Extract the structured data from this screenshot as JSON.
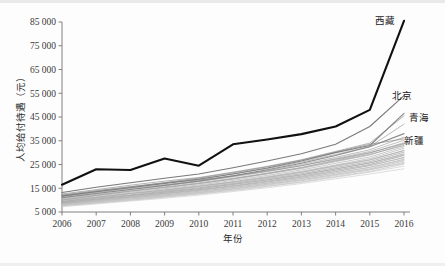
{
  "chart_data": {
    "type": "line",
    "title": "",
    "xlabel": "年份",
    "ylabel": "人均给付待遇（元）",
    "x": [
      2006,
      2007,
      2008,
      2009,
      2010,
      2011,
      2012,
      2013,
      2014,
      2015,
      2016
    ],
    "xtick_labels": [
      "2006",
      "2007",
      "2008",
      "2009",
      "2010",
      "2011",
      "2012",
      "2013",
      "2014",
      "2015",
      "2016"
    ],
    "ytick_labels": [
      "5 000",
      "15 000",
      "25 000",
      "35 000",
      "45 000",
      "55 000",
      "65 000",
      "75 000",
      "85 000"
    ],
    "ytick_values": [
      5000,
      15000,
      25000,
      35000,
      45000,
      55000,
      65000,
      75000,
      85000
    ],
    "ylim": [
      5000,
      85000
    ],
    "xlim": [
      2006,
      2016
    ],
    "grid": false,
    "legend_position": "inline-end-of-line",
    "annotations": [
      "西藏",
      "北京",
      "青海",
      "新疆"
    ],
    "colors": {
      "highlight": "#111111",
      "beijing": "#6e6e6e",
      "qinghai": "#7a7a7a",
      "xinjiang": "#838383",
      "background_lines": "#9a9a9a",
      "axis": "#808080",
      "text": "#2b2b2b"
    },
    "series": [
      {
        "name": "西藏",
        "label": "西藏",
        "highlight": true,
        "color": "#111111",
        "width": 2.1,
        "values": [
          16500,
          23000,
          22700,
          27500,
          24500,
          33500,
          35500,
          37800,
          41000,
          48000,
          85500
        ]
      },
      {
        "name": "北京",
        "label": "北京",
        "highlight": false,
        "color": "#6e6e6e",
        "width": 1.1,
        "values": [
          13200,
          15400,
          17300,
          19200,
          21000,
          23600,
          26500,
          29500,
          33500,
          41000,
          54000
        ]
      },
      {
        "name": "青海",
        "label": "青海",
        "highlight": false,
        "color": "#7a7a7a",
        "width": 1.1,
        "values": [
          11800,
          13500,
          15200,
          17000,
          18800,
          21000,
          23500,
          26500,
          30000,
          33000,
          46500
        ]
      },
      {
        "name": "新疆",
        "label": "新疆",
        "highlight": false,
        "color": "#838383",
        "width": 1.1,
        "values": [
          11000,
          12800,
          14500,
          16200,
          18000,
          20200,
          22800,
          25500,
          28800,
          32500,
          38000
        ]
      },
      {
        "name": "省份-05",
        "label": "",
        "highlight": false,
        "color": "#8d8d8d",
        "width": 0.9,
        "values": [
          12600,
          14400,
          16300,
          18000,
          19500,
          21800,
          24200,
          27000,
          30500,
          34000,
          45500
        ]
      },
      {
        "name": "省份-06",
        "label": "",
        "highlight": false,
        "color": "#949494",
        "width": 0.9,
        "values": [
          12000,
          13800,
          15500,
          17200,
          18900,
          21000,
          23300,
          26000,
          29200,
          32500,
          42000
        ]
      },
      {
        "name": "省份-07",
        "label": "",
        "highlight": false,
        "color": "#9a9a9a",
        "width": 0.9,
        "values": [
          11500,
          13200,
          14900,
          16500,
          18200,
          20200,
          22500,
          25000,
          28000,
          31200,
          36500
        ]
      },
      {
        "name": "省份-08",
        "label": "",
        "highlight": false,
        "color": "#a0a0a0",
        "width": 0.9,
        "values": [
          11200,
          12900,
          14500,
          16100,
          17800,
          19800,
          22000,
          24500,
          27500,
          30500,
          35200
        ]
      },
      {
        "name": "省份-09",
        "label": "",
        "highlight": false,
        "color": "#a4a4a4",
        "width": 0.9,
        "values": [
          10800,
          12400,
          14000,
          15600,
          17300,
          19200,
          21400,
          23800,
          26800,
          29800,
          34200
        ]
      },
      {
        "name": "省份-10",
        "label": "",
        "highlight": false,
        "color": "#a8a8a8",
        "width": 0.9,
        "values": [
          10500,
          12100,
          13700,
          15200,
          16900,
          18800,
          21000,
          23300,
          26200,
          29000,
          33500
        ]
      },
      {
        "name": "省份-11",
        "label": "",
        "highlight": false,
        "color": "#ababab",
        "width": 0.9,
        "values": [
          10200,
          11800,
          13300,
          14800,
          16400,
          18300,
          20400,
          22700,
          25500,
          28200,
          32500
        ]
      },
      {
        "name": "省份-12",
        "label": "",
        "highlight": false,
        "color": "#adadad",
        "width": 0.9,
        "values": [
          9900,
          11400,
          12900,
          14400,
          16000,
          17800,
          19900,
          22100,
          24800,
          27500,
          31800
        ]
      },
      {
        "name": "省份-13",
        "label": "",
        "highlight": false,
        "color": "#b0b0b0",
        "width": 0.9,
        "values": [
          9600,
          11100,
          12600,
          14000,
          15600,
          17400,
          19400,
          21600,
          24200,
          26800,
          31000
        ]
      },
      {
        "name": "省份-14",
        "label": "",
        "highlight": false,
        "color": "#999999",
        "width": 0.9,
        "values": [
          9300,
          10800,
          12200,
          13700,
          15200,
          17000,
          19000,
          21100,
          23700,
          26200,
          30200
        ]
      },
      {
        "name": "省份-15",
        "label": "",
        "highlight": false,
        "color": "#8f8f8f",
        "width": 0.9,
        "values": [
          9000,
          10400,
          11900,
          13300,
          14800,
          16600,
          18500,
          20600,
          23100,
          25600,
          29500
        ]
      },
      {
        "name": "省份-16",
        "label": "",
        "highlight": false,
        "color": "#959595",
        "width": 0.9,
        "values": [
          8700,
          10100,
          11500,
          12900,
          14400,
          16100,
          18000,
          20100,
          22600,
          25000,
          28800
        ]
      },
      {
        "name": "省份-17",
        "label": "",
        "highlight": false,
        "color": "#9e9e9e",
        "width": 0.9,
        "values": [
          8400,
          9800,
          11200,
          12600,
          14100,
          15800,
          17600,
          19600,
          22000,
          24500,
          28000
        ]
      },
      {
        "name": "省份-18",
        "label": "",
        "highlight": false,
        "color": "#a6a6a6",
        "width": 0.9,
        "values": [
          8200,
          9500,
          10900,
          12200,
          13700,
          15300,
          17100,
          19100,
          21400,
          23800,
          27200
        ]
      },
      {
        "name": "省份-19",
        "label": "",
        "highlight": false,
        "color": "#b2b2b2",
        "width": 0.9,
        "values": [
          8000,
          9300,
          10600,
          11900,
          13300,
          14900,
          16700,
          18600,
          20900,
          23200,
          26500
        ]
      },
      {
        "name": "省份-20",
        "label": "",
        "highlight": false,
        "color": "#b6b6b6",
        "width": 0.9,
        "values": [
          7800,
          9000,
          10300,
          11600,
          13000,
          14600,
          16300,
          18200,
          20400,
          22700,
          25900
        ]
      },
      {
        "name": "省份-21",
        "label": "",
        "highlight": false,
        "color": "#bababa",
        "width": 0.9,
        "values": [
          7600,
          8800,
          10000,
          11300,
          12700,
          14200,
          15900,
          17700,
          19900,
          22100,
          25200
        ]
      },
      {
        "name": "省份-22",
        "label": "",
        "highlight": false,
        "color": "#8a8a8a",
        "width": 0.9,
        "values": [
          12200,
          14000,
          15700,
          17200,
          18500,
          20200,
          22200,
          24500,
          27200,
          30000,
          33800
        ]
      },
      {
        "name": "省份-23",
        "label": "",
        "highlight": false,
        "color": "#969696",
        "width": 0.9,
        "values": [
          10000,
          12000,
          13800,
          15400,
          17000,
          19000,
          21200,
          23600,
          26500,
          29300,
          33000
        ]
      },
      {
        "name": "省份-24",
        "label": "",
        "highlight": false,
        "color": "#a2a2a2",
        "width": 0.9,
        "values": [
          9400,
          11200,
          12800,
          14200,
          15800,
          17600,
          19600,
          21800,
          24500,
          27000,
          30800
        ]
      },
      {
        "name": "省份-25",
        "label": "",
        "highlight": false,
        "color": "#aeaeae",
        "width": 0.9,
        "values": [
          8900,
          10600,
          12000,
          13400,
          14900,
          16700,
          18600,
          20700,
          23200,
          25700,
          29000
        ]
      },
      {
        "name": "省份-26",
        "label": "",
        "highlight": false,
        "color": "#b8b8b8",
        "width": 0.9,
        "values": [
          8500,
          10000,
          11400,
          12800,
          14200,
          15900,
          17800,
          19800,
          22200,
          24600,
          27800
        ]
      },
      {
        "name": "省份-27",
        "label": "",
        "highlight": false,
        "color": "#c0c0c0",
        "width": 0.9,
        "values": [
          8100,
          9600,
          10900,
          12300,
          13700,
          15400,
          17200,
          19200,
          21500,
          23800,
          26800
        ]
      },
      {
        "name": "省份-28",
        "label": "",
        "highlight": false,
        "color": "#c4c4c4",
        "width": 0.9,
        "values": [
          7900,
          9200,
          10500,
          11800,
          13200,
          14800,
          16600,
          18500,
          20700,
          23000,
          25500
        ]
      },
      {
        "name": "省份-29",
        "label": "",
        "highlight": false,
        "color": "#c8c8c8",
        "width": 0.9,
        "values": [
          7500,
          8700,
          9900,
          11200,
          12500,
          14000,
          15700,
          17500,
          19600,
          21800,
          24300
        ]
      },
      {
        "name": "省份-30",
        "label": "",
        "highlight": false,
        "color": "#cccccc",
        "width": 0.9,
        "values": [
          7200,
          8400,
          9600,
          10800,
          12100,
          13600,
          15200,
          17000,
          19000,
          21000,
          23200
        ]
      },
      {
        "name": "省份-31",
        "label": "",
        "highlight": false,
        "color": "#8c8c8c",
        "width": 1.0,
        "values": [
          11600,
          13600,
          15500,
          17400,
          19300,
          21500,
          24000,
          26800,
          30200,
          33500,
          35800
        ]
      }
    ]
  }
}
